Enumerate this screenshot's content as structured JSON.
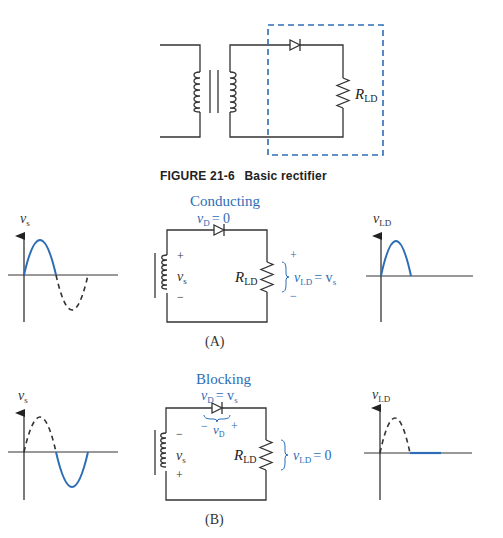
{
  "figure": {
    "number": "FIGURE 21-6",
    "title": "Basic rectifier",
    "top_circuit": {
      "resistor_label": "R",
      "resistor_sub": "LD"
    }
  },
  "panel_a": {
    "label": "(A)",
    "state": "Conducting",
    "diode_eq": {
      "v": "v",
      "sub": "D",
      "rhs": "= 0"
    },
    "source": {
      "v": "v",
      "sub": "s",
      "top_sign": "+",
      "bottom_sign": "−"
    },
    "resistor": {
      "label": "R",
      "sub": "LD"
    },
    "load_eq": {
      "v": "v",
      "sub": "LD",
      "rhs": "= v",
      "rhs_sub": "s",
      "top_sign": "+",
      "bottom_sign": "−"
    },
    "left_graph": {
      "ylabel": "v",
      "ylabel_sub": "s"
    },
    "right_graph": {
      "ylabel": "v",
      "ylabel_sub": "LD"
    }
  },
  "panel_b": {
    "label": "(B)",
    "state": "Blocking",
    "diode_eq": {
      "v": "v",
      "sub": "D",
      "rhs": "= v",
      "rhs_sub": "s"
    },
    "diode_polarity": {
      "left": "−",
      "right": "+",
      "v": "v",
      "sub": "D"
    },
    "source": {
      "v": "v",
      "sub": "s",
      "top_sign": "−",
      "bottom_sign": "+"
    },
    "resistor": {
      "label": "R",
      "sub": "LD"
    },
    "load_eq": {
      "v": "v",
      "sub": "LD",
      "rhs": "= 0"
    },
    "left_graph": {
      "ylabel": "v",
      "ylabel_sub": "s"
    },
    "right_graph": {
      "ylabel": "v",
      "ylabel_sub": "LD"
    }
  },
  "colors": {
    "accent": "#2d6db5",
    "line": "#333333"
  }
}
